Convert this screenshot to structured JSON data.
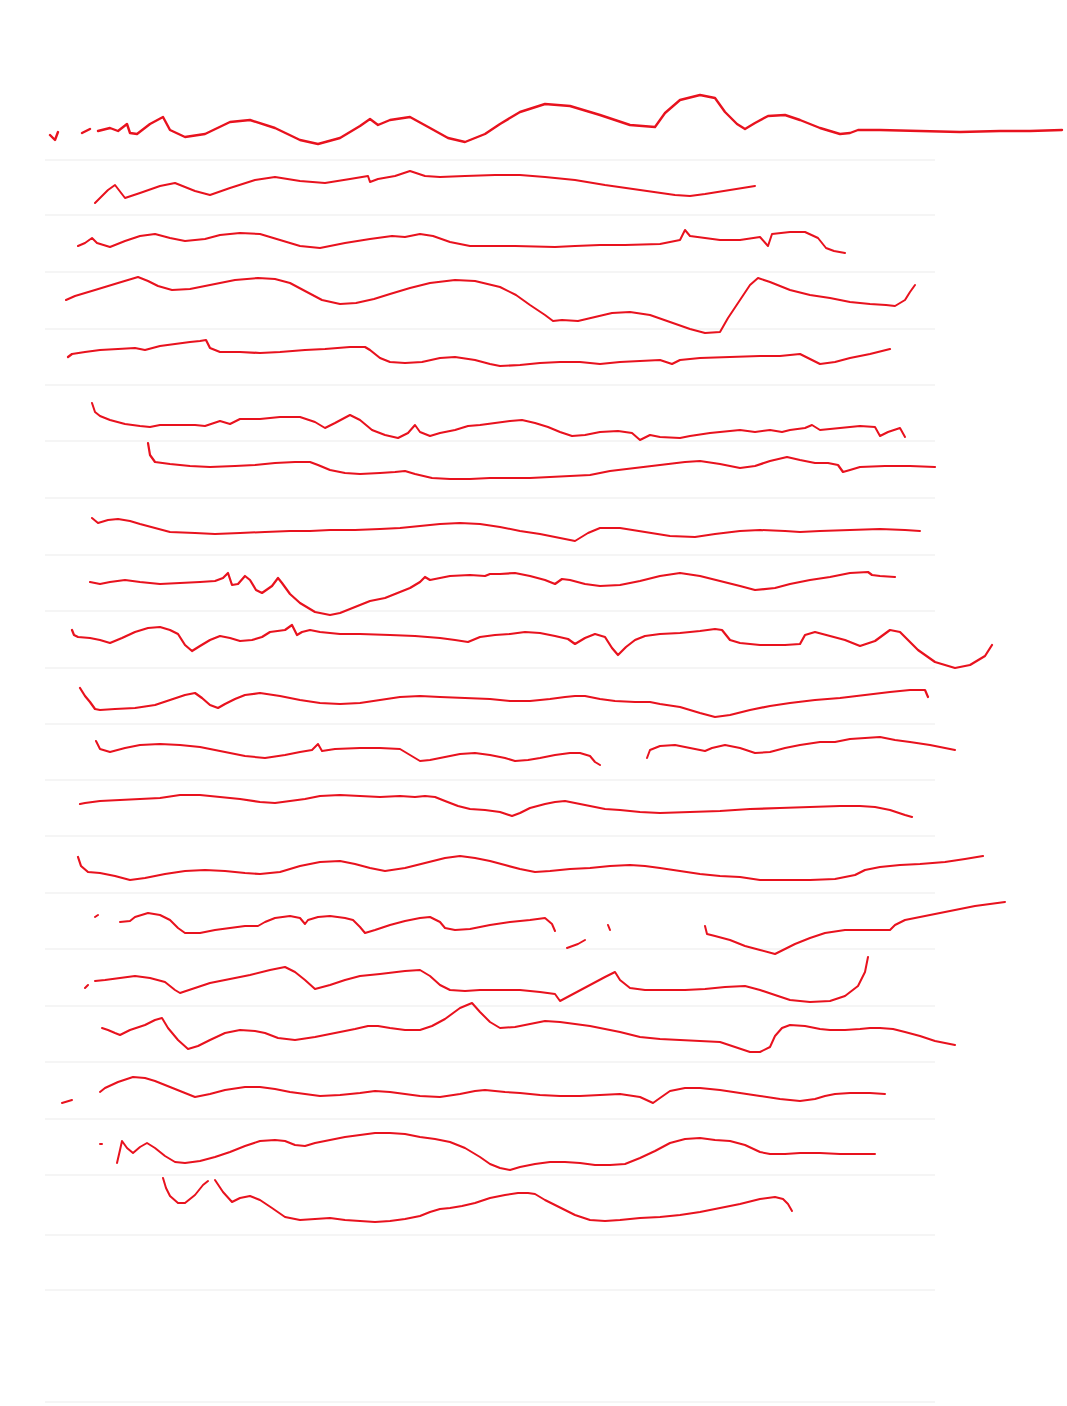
{
  "document": {
    "type": "ruled-paper-scan",
    "background_color": "#ffffff",
    "rule_color": "#ebebeb",
    "ink_color": "#e8121e",
    "rule_lines_y": [
      160,
      215,
      272,
      329,
      385,
      441,
      498,
      555,
      611,
      668,
      724,
      780,
      836,
      893,
      949,
      1006,
      1062,
      1119,
      1175,
      1235,
      1290,
      1402
    ],
    "rule_x_start": 45,
    "rule_x_end": 935,
    "scribbles": [
      {
        "d": "M50 135 L55 140 L58 132 M82 133 L90 129 M98 131 L110 128 L118 131 L127 124 L130 133 L137 134 L150 124 L163 117 L170 130 L185 137 L205 134 L230 122 L250 120 L275 128 L300 140 L318 144 L340 138 L360 126 L370 119 L378 125 L390 120 L410 117 L430 128 L448 138 L465 142 L485 134 L500 124 L520 112 L545 104 L570 106 L600 115 L630 125 L655 127 L665 113 L680 100 L700 95 L715 98 L725 112 L737 124 L745 129 L755 123 L768 116 L785 115 L800 120 L820 128 L840 134 L850 133 L858 130 L880 130 L920 131 L960 132 L1000 131 L1030 131 L1062 130",
        "w": 2.4
      },
      {
        "d": "M95 203 L108 190 L115 185 L125 198 L140 193 L160 186 L175 183 L195 191 L210 195 L230 188 L255 180 L275 177 L300 181 L325 183 L350 179 L368 176 L370 182 L378 179 L395 176 L410 171 L425 176 L440 177 L465 176 L495 175 L520 175 L545 177 L575 180 L605 185 L640 190 L675 195 L690 196 L705 194 L730 190 L755 186",
        "w": 2
      },
      {
        "d": "M78 246 L85 243 L92 238 L97 243 L110 247 L125 241 L140 236 L155 234 L170 238 L185 241 L205 239 L220 235 L240 233 L260 234 L280 240 L300 246 L320 248 L345 243 L370 239 L392 236 L405 237 L420 234 L433 236 L450 242 L470 246 L490 246 L515 246 L555 247 L575 246 L600 245 L625 245 L660 244 L680 240 L685 230 L690 236 L705 238 L720 240 L740 240 L760 237 L768 246 L772 234 L790 232 L805 232 L818 238 L826 248 L834 251 L845 253",
        "w": 2
      },
      {
        "d": "M66 300 L75 296 L95 290 L118 283 L138 277 L148 281 L158 286 L172 290 L190 289 L210 285 L235 280 L258 278 L275 279 L290 283 L305 291 L322 300 L340 304 L356 303 L374 299 L390 294 L410 288 L430 283 L455 280 L475 281 L500 287 L516 295 L530 305 L545 315 L553 321 L562 320 L578 321 L595 317 L612 313 L630 312 L650 315 L670 322 L690 329 L705 333 L720 332 L728 318 L740 300 L750 285 L758 278 L770 282 L790 290 L810 295 L830 298 L850 302 L870 304 L886 305 L895 306 L905 300 L910 292 L915 285",
        "w": 2
      },
      {
        "d": "M68 357 L72 354 L85 352 L100 350 L118 349 L135 348 L145 350 L160 346 L190 342 L200 341 L206 340 L210 348 L220 352 L240 352 L260 353 L280 352 L305 350 L325 349 L350 347 L365 347 L370 350 L380 358 L390 362 L405 363 L422 362 L440 358 L455 357 L475 360 L490 364 L500 366 L520 365 L540 363 L560 362 L580 362 L590 363 L600 364 L620 362 L640 361 L660 360 L672 364 L680 360 L700 358 L730 357 L760 356 L780 356 L800 354 L812 360 L820 364 L835 362 L850 358 L870 354 L890 349",
        "w": 2.2
      },
      {
        "d": "M92 403 L95 412 L100 416 L110 420 L125 424 L140 426 L150 427 L160 425 L180 425 L195 425 L205 426 L220 421 L230 424 L240 419 L260 419 L280 417 L300 417 L315 422 L325 428 L335 423 L350 415 L360 420 L372 430 L385 435 L398 438 L408 433 L415 425 L420 432 L430 436 L440 433 L455 430 L468 426 L480 425 L495 423 L510 421 L522 420 L535 423 L548 427 L560 432 L572 436 L585 435 L600 432 L618 431 L632 433 L640 440 L650 435 L660 437 L680 438 L690 436 L710 433 L740 430 L755 432 L770 430 L782 432 L790 430 L805 428 L812 425 L820 430 L840 428 L860 426 L875 427 L880 436 L888 432 L900 428 L905 437",
        "w": 2
      },
      {
        "d": "M148 443 L150 455 L155 462 L170 464 L190 466 L210 467 L235 466 L255 465 L275 463 L295 462 L310 462 L318 465 L330 470 L345 473 L360 474 L380 473 L395 472 L405 471 L415 474 L432 478 L450 479 L470 479 L490 478 L510 478 L530 478 L550 477 L570 476 L590 475 L610 471 L635 468 L660 465 L685 462 L700 461 L720 464 L740 468 L755 466 L770 461 L787 457 L800 460 L815 463 L828 463 L838 465 L843 472 L850 470 L860 467 L885 466 L910 466 L935 467",
        "w": 2.2
      },
      {
        "d": "M92 518 L98 523 L108 520 L118 519 L130 521 L140 524 L155 528 L170 532 L195 533 L215 534 L240 533 L265 532 L290 531 L310 531 L330 530 L355 530 L380 529 L400 528 L420 526 L440 524 L460 523 L480 524 L500 527 L520 531 L540 534 L560 538 L575 541 L588 533 L600 528 L620 528 L645 532 L670 536 L695 537 L715 534 L740 531 L760 530 L785 531 L800 532 L820 531 L850 530 L880 529 L905 530 L920 531",
        "w": 2
      },
      {
        "d": "M90 582 L100 584 L110 582 L125 580 L140 582 L160 584 L180 583 L200 582 L215 581 L223 578 L228 573 L232 585 L238 584 L245 576 L250 580 L256 590 L262 593 L272 586 L278 578 L282 583 L290 594 L300 603 L315 612 L330 615 L340 613 L355 607 L370 601 L385 598 L400 592 L410 588 L420 582 L425 577 L430 580 L440 578 L450 576 L470 575 L485 576 L490 574 L500 574 L515 573 L530 576 L545 580 L555 584 L562 579 L570 580 L585 584 L600 586 L620 585 L640 581 L660 576 L680 573 L700 576 L720 581 L740 586 L755 590 L775 588 L790 584 L810 580 L830 577 L850 573 L868 572 L872 575 L880 576 L895 577",
        "w": 2.2
      },
      {
        "d": "M72 630 L74 635 L78 637 L90 638 L100 640 L110 643 L122 638 L135 632 L148 628 L160 627 L170 630 L178 634 L185 645 L192 651 L200 646 L210 640 L220 636 L230 638 L240 641 L252 640 L262 637 L270 632 L285 630 L292 625 L297 635 L302 632 L310 630 L320 632 L340 634 L360 634 L390 635 L415 636 L440 638 L455 640 L468 642 L480 637 L495 635 L510 634 L525 632 L540 633 L555 636 L568 639 L575 644 L585 638 L595 634 L605 637 L612 648 L618 655 L626 647 L635 640 L645 636 L660 634 L680 633 L700 631 L715 629 L722 630 L730 640 L740 643 L760 645 L785 645 L800 644 L805 635 L815 632 L830 636 L845 640 L860 646 L875 641 L890 630 L900 632 L918 650 L935 662 L955 668 L970 665 L985 656 L992 645",
        "w": 2.2
      },
      {
        "d": "M80 688 L85 696 L90 702 L95 709 L100 710 L115 709 L135 708 L155 705 L170 700 L185 695 L195 693 L202 698 L210 705 L218 708 L225 704 L235 699 L245 695 L260 693 L280 696 L300 700 L320 703 L340 704 L360 703 L380 700 L400 697 L420 696 L440 697 L465 698 L490 699 L510 701 L530 701 L550 699 L565 697 L575 696 L585 696 L600 699 L615 701 L635 702 L650 702 L660 704 L680 707 L700 713 L715 717 L730 715 L750 710 L770 706 L790 703 L815 700 L840 698 L865 695 L890 692 L910 690 L925 690 L928 697",
        "w": 2.2
      },
      {
        "d": "M96 741 L100 749 L110 752 L125 748 L140 745 L160 744 L180 745 L200 747 L225 752 L245 756 L265 758 L285 755 L300 752 L312 750 L318 744 L322 751 L335 749 L360 748 L380 748 L400 749 L410 755 L420 761 L430 760 L445 757 L460 754 L475 753 L490 755 L505 758 L515 761 L528 760 L540 758 L555 755 L570 753 L580 753 L590 756 L595 762 L600 765 M647 758 L650 750 L660 746 L675 745 L690 748 L705 751 L712 748 L725 745 L740 748 L755 753 L770 752 L785 748 L800 745 L820 742 L835 742 L840 741 L850 739 L865 738 L880 737 L895 740 L910 742 L930 745 L955 750",
        "w": 2
      },
      {
        "d": "M80 804 L85 803 L100 801 L120 800 L140 799 L160 798 L180 795 L200 795 L220 797 L240 799 L260 802 L275 803 L290 801 L305 799 L320 796 L340 795 L360 796 L380 797 L400 796 L415 797 L425 796 L435 797 L445 801 L458 806 L470 809 L485 810 L500 812 L512 816 L520 813 L530 808 L545 804 L555 802 L565 801 L575 803 L590 806 L605 809 L620 810 L640 812 L660 813 L690 812 L720 811 L750 809 L780 808 L810 807 L840 806 L860 806 L875 807 L890 810 L905 815 L912 817",
        "w": 2.2
      },
      {
        "d": "M78 857 L81 866 L88 872 L100 873 L115 876 L130 880 L145 878 L165 874 L185 871 L205 870 L225 871 L245 873 L260 874 L280 872 L300 866 L320 862 L340 861 L355 864 L370 868 L385 871 L405 868 L425 863 L445 858 L460 856 L475 858 L490 861 L505 865 L520 869 L535 872 L550 871 L570 869 L590 868 L610 866 L630 865 L645 866 L660 868 L680 871 L700 874 L720 876 L740 877 L760 880 L785 880 L810 880 L835 879 L855 875 L865 870 L880 867 L900 865 L920 864 L945 862 L965 859 L983 856",
        "w": 2.2
      },
      {
        "d": "M95 917 L98 915 M120 922 L130 921 L135 917 L148 913 L160 915 L170 920 L178 928 L185 933 L200 933 L215 930 L230 928 L245 926 L258 926 L265 922 L275 918 L290 916 L300 918 L305 924 L308 920 L318 917 L330 916 L345 918 L353 920 L360 927 L365 933 L375 930 L390 925 L405 921 L420 918 L430 917 L440 922 L445 928 L455 930 L470 929 L490 925 L510 922 L530 920 L545 918 L552 924 L555 931 M567 948 L578 944 L585 940 M608 925 L610 930 M705 926 L707 934 L715 936 L730 940 L745 946 L760 950 L775 954 L785 949 L795 944 L810 938 L825 933 L845 930 L870 930 L890 930 L895 925 L905 920 L925 916 L950 911 L975 906 L1005 902",
        "w": 2
      },
      {
        "d": "M85 988 L88 985 M95 981 L105 980 L120 978 L135 976 L150 978 L165 982 L175 990 L180 993 L195 988 L210 983 L230 979 L250 975 L270 970 L285 967 L295 972 L305 980 L315 989 L330 985 L345 980 L360 976 L380 974 L405 971 L420 970 L430 976 L440 985 L450 990 L465 991 L480 990 L500 990 L520 990 L540 992 L555 994 L560 1001 L575 993 L590 985 L605 977 L615 972 L620 980 L630 988 L645 990 L665 990 L685 990 L705 989 L725 987 L745 986 L760 990 L775 995 L790 1000 L810 1002 L830 1001 L845 996 L858 986 L865 972 L868 957",
        "w": 2
      },
      {
        "d": "M102 1028 L108 1030 L115 1033 L120 1035 L130 1030 L145 1025 L155 1020 L162 1018 L168 1028 L178 1040 L188 1049 L198 1046 L210 1040 L225 1033 L240 1030 L255 1031 L265 1033 L278 1038 L295 1040 L315 1037 L335 1033 L355 1029 L368 1026 L378 1026 L390 1028 L405 1030 L420 1030 L432 1026 L445 1019 L460 1008 L472 1003 L480 1012 L490 1022 L500 1028 L515 1027 L530 1024 L545 1021 L560 1022 L575 1024 L590 1026 L605 1029 L620 1032 L640 1037 L660 1039 L680 1040 L700 1041 L720 1042 L735 1047 L750 1052 L760 1052 L770 1047 L775 1036 L782 1028 L790 1025 L805 1026 L820 1029 L830 1030 L845 1030 L860 1029 L870 1028 L880 1028 L893 1029 L905 1032 L920 1036 L935 1041 L955 1045",
        "w": 2
      },
      {
        "d": "M62 1103 L72 1100 M100 1092 L105 1088 L118 1082 L133 1077 L145 1078 L155 1081 L170 1087 L185 1093 L195 1097 L210 1094 L225 1090 L245 1087 L260 1087 L275 1089 L290 1092 L305 1094 L320 1096 L340 1095 L360 1093 L375 1091 L390 1092 L405 1094 L420 1096 L440 1097 L460 1094 L475 1091 L485 1090 L495 1091 L505 1092 L520 1093 L540 1095 L560 1096 L580 1096 L600 1095 L620 1094 L640 1097 L653 1103 L660 1098 L670 1091 L685 1088 L700 1088 L720 1090 L740 1093 L760 1096 L780 1099 L800 1101 L815 1099 L825 1096 L835 1094 L850 1093 L870 1093 L885 1094",
        "w": 2
      },
      {
        "d": "M100 1144 L102 1144 M117 1163 L120 1150 L122 1141 L127 1148 L133 1153 L140 1147 L147 1143 L155 1148 L165 1156 L175 1162 L185 1163 L200 1161 L215 1157 L230 1152 L245 1146 L260 1141 L275 1140 L285 1141 L295 1145 L305 1146 L315 1143 L330 1140 L345 1137 L360 1135 L375 1133 L390 1133 L405 1134 L420 1137 L435 1139 L450 1142 L465 1148 L480 1157 L490 1164 L500 1168 L510 1170 L520 1167 L535 1164 L550 1162 L565 1162 L580 1163 L595 1165 L610 1165 L625 1164 L640 1158 L655 1151 L670 1143 L685 1139 L700 1138 L715 1140 L730 1141 L745 1145 L760 1152 L770 1154 L785 1154 L800 1153 L820 1153 L840 1154 L860 1154 L875 1154",
        "w": 2
      },
      {
        "d": "M163 1178 L166 1188 L170 1196 L178 1203 L185 1203 L195 1195 L203 1185 L208 1181 M215 1180 L223 1192 L232 1202 L240 1198 L250 1196 L260 1200 L272 1208 L285 1217 L300 1220 L315 1219 L330 1218 L345 1220 L360 1221 L375 1222 L390 1221 L405 1219 L420 1216 L430 1212 L440 1209 L450 1208 L462 1206 L475 1203 L490 1198 L505 1195 L518 1193 L528 1193 L535 1194 L545 1200 L555 1205 L565 1210 L575 1215 L590 1220 L605 1221 L620 1220 L640 1218 L660 1217 L680 1215 L700 1212 L720 1208 L740 1204 L760 1199 L775 1197 L783 1199 L788 1204 L792 1211",
        "w": 2
      }
    ]
  }
}
